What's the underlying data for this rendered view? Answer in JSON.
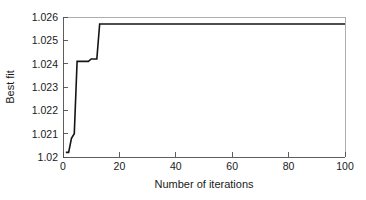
{
  "chart_data": {
    "type": "line",
    "title": "",
    "xlabel": "Number of iterations",
    "ylabel": "Best fit",
    "xlim": [
      0,
      100
    ],
    "ylim": [
      1.02,
      1.026
    ],
    "xticks": [
      0,
      20,
      40,
      60,
      80,
      100
    ],
    "xtick_labels": [
      "0",
      "20",
      "40",
      "60",
      "80",
      "100"
    ],
    "yticks": [
      1.02,
      1.021,
      1.022,
      1.023,
      1.024,
      1.025,
      1.026
    ],
    "ytick_labels": [
      "1.02",
      "1.021",
      "1.022",
      "1.023",
      "1.024",
      "1.025",
      "1.026"
    ],
    "grid": false,
    "legend": null,
    "legend_position": "none",
    "line_color": "#151515",
    "series": [
      {
        "name": "Best fit",
        "x": [
          1,
          2,
          3,
          4,
          5,
          6,
          7,
          8,
          9,
          10,
          11,
          12,
          13,
          14,
          20,
          40,
          60,
          80,
          100
        ],
        "values": [
          1.0202,
          1.0202,
          1.0208,
          1.021,
          1.0241,
          1.0241,
          1.0241,
          1.0241,
          1.0241,
          1.0242,
          1.0242,
          1.0242,
          1.0257,
          1.0257,
          1.0257,
          1.0257,
          1.0257,
          1.0257,
          1.0257
        ]
      }
    ]
  },
  "axes": {
    "y_axis_title": "Best fit",
    "x_axis_title": "Number of iterations"
  }
}
